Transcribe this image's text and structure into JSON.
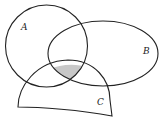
{
  "diagram": {
    "type": "venn",
    "sets": [
      {
        "label": "A"
      },
      {
        "label": "B"
      },
      {
        "label": "C"
      }
    ],
    "shaded_region": "A ∩ B ∩ C",
    "colors": {
      "stroke": "#222222",
      "shade": "#c8c8c8",
      "background": "#ffffff"
    }
  }
}
